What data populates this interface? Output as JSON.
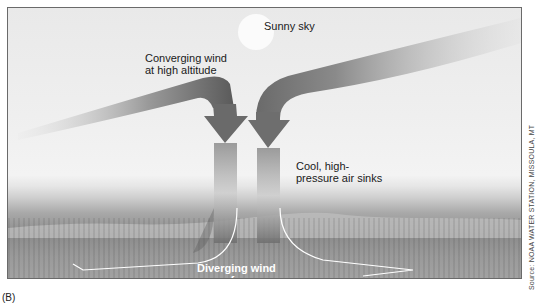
{
  "figure": {
    "panel_label": "(B)",
    "source_credit": "Source: NOAA WATER STATION, MISSOULA, MT"
  },
  "labels": {
    "sky": "Sunny sky",
    "converging_line1": "Converging wind",
    "converging_line2": "at high altitude",
    "sinking_line1": "Cool, high-",
    "sinking_line2": "pressure air sinks",
    "diverging_line1": "Diverging wind",
    "diverging_line2": "on surface"
  },
  "colors": {
    "arrow_dark": "#5a5a5a",
    "arrow_light": "#c8c8c8",
    "surface_line": "#ffffff",
    "border": "#6a6a6a"
  }
}
